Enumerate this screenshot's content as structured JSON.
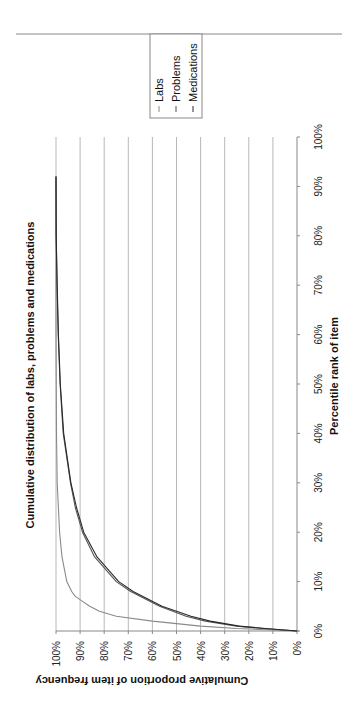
{
  "chart_data": {
    "type": "line",
    "orientation_note": "figure rotated 90 degrees clockwise",
    "title": "Cumulative distribution of labs, problems and medications",
    "xlabel": "Percentile rank of item",
    "ylabel": "Cumulative proportion of item frequency",
    "x_ticks": [
      "0%",
      "10%",
      "20%",
      "30%",
      "40%",
      "50%",
      "60%",
      "70%",
      "80%",
      "90%",
      "100%"
    ],
    "y_ticks": [
      "0%",
      "10%",
      "20%",
      "30%",
      "40%",
      "50%",
      "60%",
      "70%",
      "80%",
      "90%",
      "100%"
    ],
    "xlim": [
      0,
      100
    ],
    "ylim": [
      0,
      100
    ],
    "grid": true,
    "legend_position": "right",
    "series": [
      {
        "name": "Labs",
        "color": "#8a8a8a",
        "x": [
          0,
          0.5,
          1,
          2,
          3,
          4,
          5,
          6,
          7,
          8,
          10,
          15,
          20,
          30,
          40,
          60,
          92
        ],
        "y": [
          0,
          25,
          40,
          60,
          75,
          82,
          86,
          89,
          92,
          93.5,
          95.5,
          97.5,
          98.5,
          99.5,
          99.8,
          100,
          100
        ]
      },
      {
        "name": "Problems",
        "color": "#555555",
        "x": [
          0,
          0.5,
          1,
          2,
          3,
          5,
          8,
          10,
          15,
          20,
          25,
          30,
          40,
          50,
          60,
          70,
          80,
          92
        ],
        "y": [
          0,
          14,
          25,
          38,
          46,
          57,
          69,
          75,
          84,
          89,
          92,
          94,
          97,
          98.3,
          99.1,
          99.6,
          99.9,
          100
        ]
      },
      {
        "name": "Medications",
        "color": "#2a2a2a",
        "x": [
          0,
          0.5,
          1,
          2,
          3,
          5,
          8,
          10,
          15,
          20,
          25,
          30,
          40,
          50,
          60,
          70,
          80,
          92
        ],
        "y": [
          0,
          13,
          24,
          36,
          44,
          56,
          68,
          74,
          83,
          88.5,
          91.5,
          93.8,
          96.8,
          98.2,
          99,
          99.5,
          99.9,
          100
        ]
      }
    ]
  },
  "legend": {
    "items": [
      "Labs",
      "Problems",
      "Medications"
    ]
  }
}
